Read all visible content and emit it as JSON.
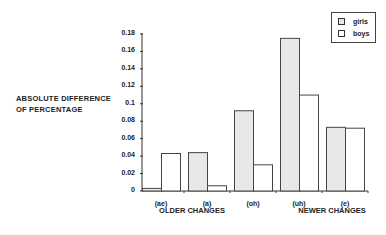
{
  "chart_data": {
    "type": "bar",
    "title": "",
    "xlabel": "",
    "ylabel": "ABSOLUTE DIFFERENCE OF PERCENTAGE",
    "ylabel_lines": [
      "ABSOLUTE DIFFERENCE",
      "OF PERCENTAGE"
    ],
    "ylim": [
      0,
      0.18
    ],
    "yticks": [
      "0",
      "0.02",
      "0.04",
      "0.06",
      "0.08",
      "0.1",
      "0.12",
      "0.14",
      "0.16",
      "0.18"
    ],
    "categories": [
      "(ae)",
      "(a)",
      "(oh)",
      "(uh)",
      "(e)"
    ],
    "category_groups": [
      {
        "label": "OLDER CHANGES",
        "categories": [
          "(ae)",
          "(a)"
        ]
      },
      {
        "label": "NEWER CHANGES",
        "categories": [
          "(uh)",
          "(e)"
        ]
      }
    ],
    "series": [
      {
        "name": "girls",
        "color": "#e8e8e8",
        "values": [
          0.003,
          0.044,
          0.092,
          0.175,
          0.073
        ]
      },
      {
        "name": "boys",
        "color": "#ffffff",
        "values": [
          0.043,
          0.006,
          0.03,
          0.11,
          0.072
        ]
      }
    ],
    "legend_position": "top-right",
    "grid": false
  }
}
